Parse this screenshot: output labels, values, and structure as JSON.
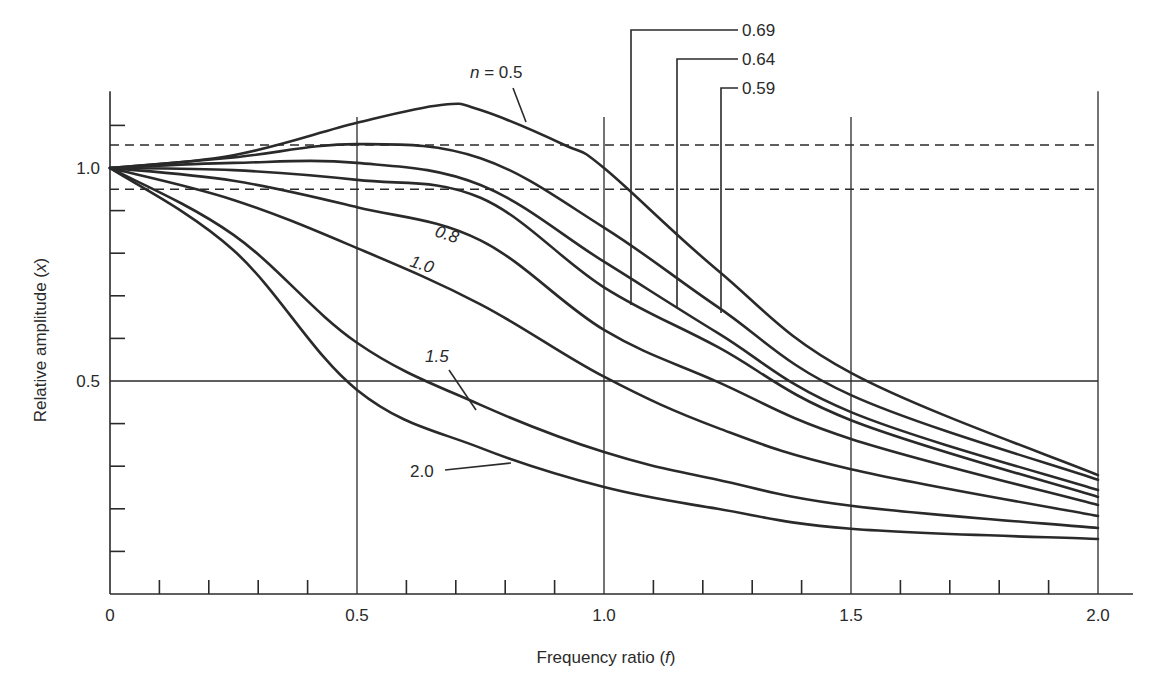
{
  "chart_data": {
    "type": "line",
    "title": "",
    "xlabel": "Frequency ratio",
    "xlabel_var": "f",
    "ylabel": "Relative amplitude",
    "ylabel_var": "x",
    "xlim": [
      0,
      2.0
    ],
    "ylim": [
      0,
      1.18
    ],
    "x_ticks": [
      0,
      0.5,
      1.0,
      1.5,
      2.0
    ],
    "x_tick_labels": [
      "0",
      "0.5",
      "1.0",
      "1.5",
      "2.0"
    ],
    "x_minor_step": 0.1,
    "y_ticks": [
      0.5,
      1.0
    ],
    "y_tick_labels": [
      "0.5",
      "1.0"
    ],
    "y_minor_step": 0.1,
    "grid": {
      "vertical_lines_at_x": [
        0.5,
        1.0,
        1.5,
        2.0
      ],
      "horizontal_lines_at_y": [
        0.5
      ],
      "dashed_lines_at_y": [
        1.054,
        0.95
      ]
    },
    "legend": "none (inline curve labels)",
    "series": [
      {
        "name": "n = 0.5",
        "label": "n = 0.5",
        "x": [
          0,
          0.25,
          0.5,
          0.67,
          0.75,
          0.92,
          1.0,
          1.23,
          1.5,
          2.0
        ],
        "values": [
          1.0,
          1.03,
          1.106,
          1.148,
          1.136,
          1.054,
          1.0,
          0.76,
          0.519,
          0.279
        ]
      },
      {
        "name": "n = 0.59",
        "label": "0.59",
        "x": [
          0,
          0.25,
          0.5,
          0.75,
          1.0,
          1.23,
          1.5,
          2.0
        ],
        "values": [
          1.0,
          1.025,
          1.056,
          1.023,
          0.86,
          0.674,
          0.467,
          0.268
        ]
      },
      {
        "name": "n = 0.64",
        "label": "0.64",
        "x": [
          0,
          0.25,
          0.5,
          0.75,
          1.0,
          1.23,
          1.5,
          2.0
        ],
        "values": [
          1.0,
          1.012,
          1.012,
          0.96,
          0.78,
          0.613,
          0.427,
          0.244
        ]
      },
      {
        "name": "n = 0.69",
        "label": "0.69",
        "x": [
          0,
          0.25,
          0.5,
          0.75,
          1.0,
          1.23,
          1.5,
          2.0
        ],
        "values": [
          1.0,
          0.995,
          0.972,
          0.93,
          0.72,
          0.58,
          0.408,
          0.228
        ]
      },
      {
        "name": "n = 0.8",
        "label": "0.8",
        "x": [
          0,
          0.25,
          0.5,
          0.75,
          1.0,
          1.23,
          1.5,
          2.0
        ],
        "values": [
          1.0,
          0.97,
          0.908,
          0.83,
          0.62,
          0.498,
          0.364,
          0.209
        ]
      },
      {
        "name": "n = 1.0",
        "label": "1.0",
        "x": [
          0,
          0.25,
          0.5,
          0.75,
          1.0,
          1.23,
          1.5,
          2.0
        ],
        "values": [
          1.0,
          0.925,
          0.812,
          0.68,
          0.51,
          0.39,
          0.293,
          0.183
        ]
      },
      {
        "name": "n = 1.5",
        "label": "1.5",
        "x": [
          0,
          0.25,
          0.5,
          0.75,
          1.0,
          1.23,
          1.5,
          2.0
        ],
        "values": [
          1.0,
          0.843,
          0.59,
          0.444,
          0.333,
          0.268,
          0.207,
          0.155
        ]
      },
      {
        "name": "n = 2.0",
        "label": "2.0",
        "x": [
          0,
          0.25,
          0.5,
          0.75,
          1.0,
          1.23,
          1.5,
          2.0
        ],
        "values": [
          1.0,
          0.807,
          0.479,
          0.343,
          0.251,
          0.2,
          0.153,
          0.129
        ]
      }
    ],
    "annotations": [
      {
        "text": "n = 0.5",
        "style": "leader line",
        "target_series": "n = 0.5"
      },
      {
        "text": "0.69",
        "style": "bracket leader from top",
        "target_series": "n = 0.69",
        "at_x": 1.05
      },
      {
        "text": "0.64",
        "style": "bracket leader from top",
        "target_series": "n = 0.64",
        "at_x": 1.14
      },
      {
        "text": "0.59",
        "style": "bracket leader from top",
        "target_series": "n = 0.59",
        "at_x": 1.23
      },
      {
        "text": "0.8",
        "style": "inline italic",
        "target_series": "n = 0.8"
      },
      {
        "text": "1.0",
        "style": "inline italic",
        "target_series": "n = 1.0"
      },
      {
        "text": "1.5",
        "style": "italic with leader",
        "target_series": "n = 1.5"
      },
      {
        "text": "2.0",
        "style": "leader line",
        "target_series": "n = 2.0"
      }
    ]
  },
  "labels": {
    "x_axis_title": "Frequency ratio (",
    "x_axis_var": "f",
    "x_axis_close": ")",
    "y_axis_title": "Relative amplitude (",
    "y_axis_var": "x",
    "y_axis_close": ")",
    "n_prefix": "n",
    "n_eq": " = 0.5",
    "lbl_069": "0.69",
    "lbl_064": "0.64",
    "lbl_059": "0.59",
    "lbl_08": "0.8",
    "lbl_10": "1.0",
    "lbl_15": "1.5",
    "lbl_20": "2.0"
  },
  "colors": {
    "ink": "#2a2a2a",
    "background": "#ffffff"
  }
}
